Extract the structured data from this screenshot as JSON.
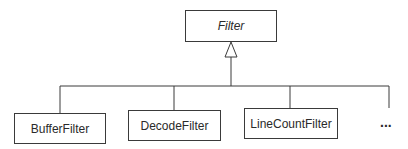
{
  "diagram": {
    "type": "UML class hierarchy",
    "parent": {
      "name": "Filter",
      "abstract": true
    },
    "children": [
      {
        "name": "BufferFilter"
      },
      {
        "name": "DecodeFilter"
      },
      {
        "name": "LineCountFilter"
      }
    ],
    "more_indicator": "...",
    "relationship": "generalization",
    "colors": {
      "line": "#3a3a3a",
      "text": "#2a2a2a",
      "background": "#ffffff"
    }
  }
}
